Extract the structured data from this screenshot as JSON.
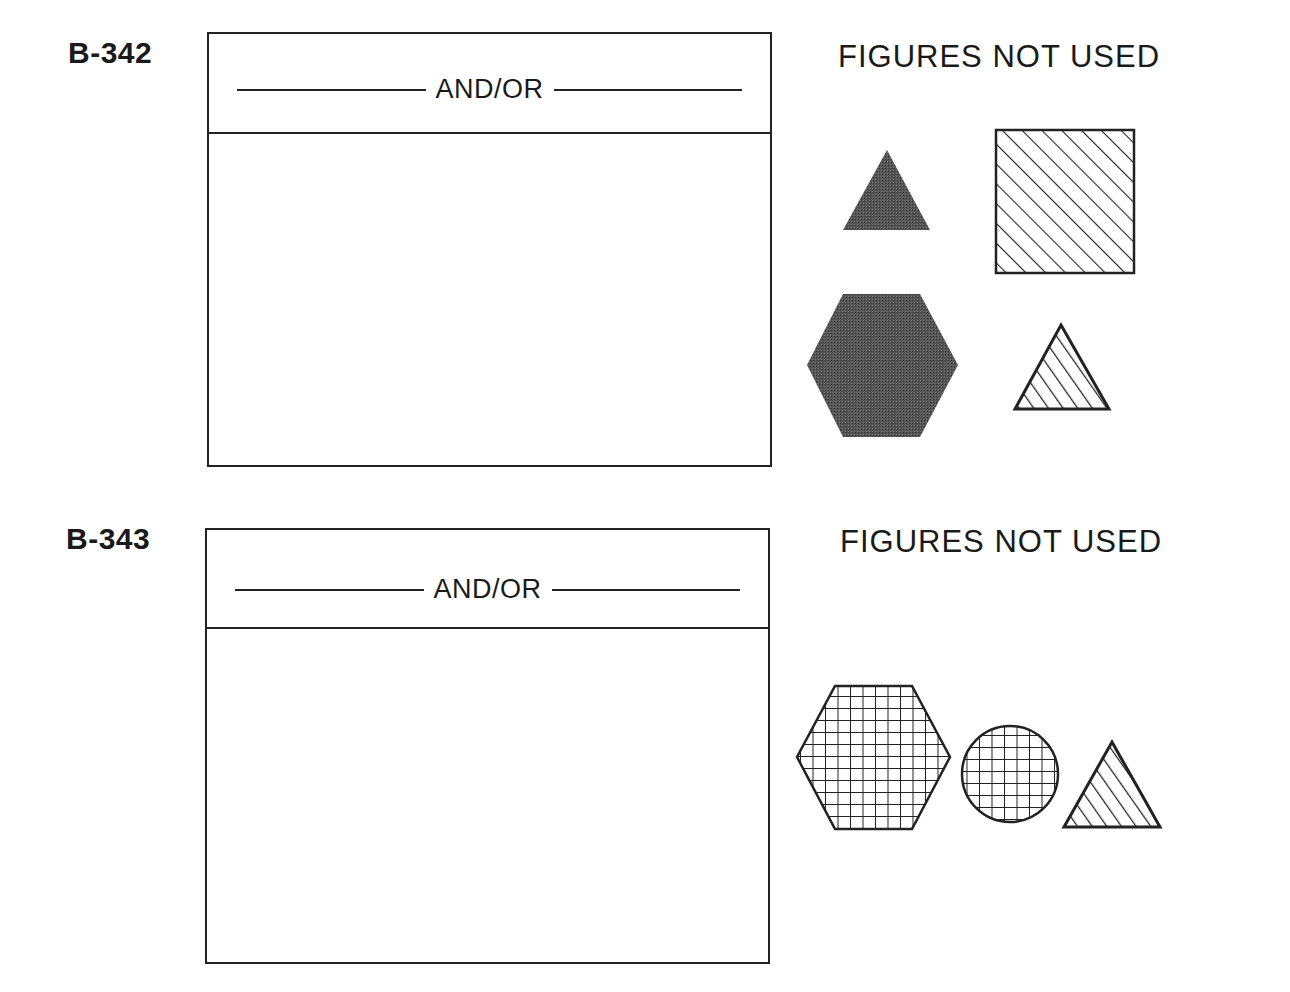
{
  "items": [
    {
      "id": "B-342",
      "answer_box_label": "AND/OR",
      "unused_label": "FIGURES NOT USED",
      "figures_not_used": [
        {
          "shape": "triangle",
          "fill": "dark-stipple"
        },
        {
          "shape": "square",
          "fill": "diagonal-hatch"
        },
        {
          "shape": "hexagon",
          "fill": "dark-stipple"
        },
        {
          "shape": "triangle",
          "fill": "diagonal-hatch"
        }
      ]
    },
    {
      "id": "B-343",
      "answer_box_label": "AND/OR",
      "unused_label": "FIGURES NOT USED",
      "figures_not_used": [
        {
          "shape": "hexagon",
          "fill": "grid"
        },
        {
          "shape": "circle",
          "fill": "grid"
        },
        {
          "shape": "triangle",
          "fill": "diagonal-hatch"
        }
      ]
    }
  ],
  "colors": {
    "ink": "#222222",
    "stipple": "#4a4a4a",
    "background": "#ffffff"
  }
}
